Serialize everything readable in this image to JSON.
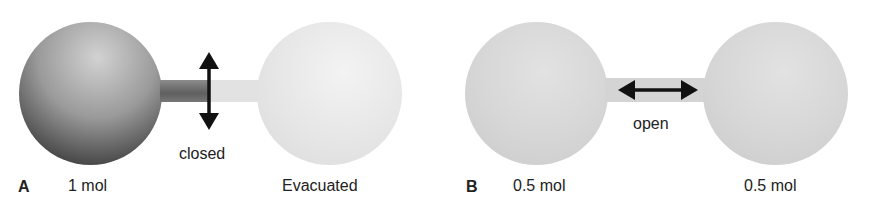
{
  "panels": [
    {
      "letter": "A",
      "valve_state": "closed",
      "left_bulb": {
        "label": "1 mol",
        "fill": "gas"
      },
      "right_bulb": {
        "label": "Evacuated",
        "fill": "empty"
      },
      "arrow": "vertical-double-arrow"
    },
    {
      "letter": "B",
      "valve_state": "open",
      "left_bulb": {
        "label": "0.5 mol",
        "fill": "gas"
      },
      "right_bulb": {
        "label": "0.5 mol",
        "fill": "gas"
      },
      "arrow": "horizontal-double-arrow"
    }
  ],
  "colors": {
    "gas_dark": "#3a3a3a",
    "gas_light": "#d4d4d4",
    "empty": "#e8e8e8",
    "arrow": "#111111"
  }
}
